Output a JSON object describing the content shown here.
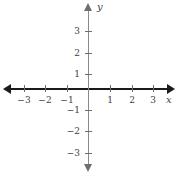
{
  "figure": {
    "title": "",
    "background_color": "#ffffff",
    "axis_color_x": "#1a1a1a",
    "axis_color_y": "#8a8a8a",
    "tick_color": "#6e6e6e",
    "label_color": "#3d3d3d"
  },
  "axes": {
    "x_label": "x",
    "y_label": "y"
  },
  "chart_data": {
    "type": "scatter",
    "title": "",
    "xlabel": "x",
    "ylabel": "y",
    "xlim": [
      -3.7,
      3.7
    ],
    "ylim": [
      -3.7,
      3.7
    ],
    "grid": false,
    "legend": false,
    "x_ticks": [
      -3,
      -2,
      -1,
      1,
      2,
      3
    ],
    "y_ticks": [
      -3,
      -2,
      -1,
      1,
      2,
      3
    ],
    "x_tick_labels": [
      "−3",
      "−2",
      "−1",
      "1",
      "2",
      "3"
    ],
    "y_tick_labels": [
      "−3",
      "−2",
      "−1",
      "1",
      "2",
      "3"
    ],
    "series": [
      {
        "name": "data",
        "x": [],
        "y": []
      }
    ],
    "annotations": []
  },
  "ticks": {
    "x": [
      {
        "value": -3,
        "label": "−3",
        "px": 24
      },
      {
        "value": -2,
        "label": "−2",
        "px": 45
      },
      {
        "value": -1,
        "label": "−1",
        "px": 67
      },
      {
        "value": 1,
        "label": "1",
        "px": 110
      },
      {
        "value": 2,
        "label": "2",
        "px": 132
      },
      {
        "value": 3,
        "label": "3",
        "px": 153
      }
    ],
    "y": [
      {
        "value": 3,
        "label": "3",
        "px": 31
      },
      {
        "value": 2,
        "label": "2",
        "px": 53
      },
      {
        "value": 1,
        "label": "1",
        "px": 74
      },
      {
        "value": -1,
        "label": "−1",
        "px": 110
      },
      {
        "value": -2,
        "label": "−2",
        "px": 131
      },
      {
        "value": -3,
        "label": "−3",
        "px": 153
      }
    ]
  }
}
